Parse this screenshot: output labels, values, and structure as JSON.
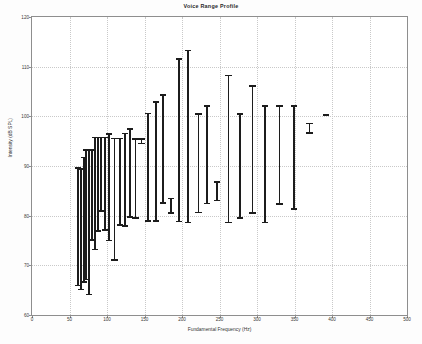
{
  "figure": {
    "title": "Voice Range Profile",
    "background_color": "#ffffff",
    "axis_color": "#8e8e8e",
    "grid_color": "#c9c9c9",
    "data_color": "#1c1c1c"
  },
  "chart_data": {
    "type": "bar",
    "title": "Voice Range Profile",
    "xlabel": "Fundamental Frequency (Hz)",
    "ylabel": "Intensity (dB SPL)",
    "xlim": [
      0,
      500
    ],
    "ylim": [
      60,
      120
    ],
    "xticks": [
      0,
      50,
      100,
      150,
      200,
      250,
      300,
      350,
      400,
      450,
      500
    ],
    "yticks": [
      60,
      70,
      80,
      90,
      100,
      110,
      120
    ],
    "grid": true,
    "legend": "none",
    "series_note": "Each vertical bar spans the minimum to maximum intensity measured at that fundamental frequency.",
    "x": [
      61,
      65,
      69,
      72,
      76,
      80,
      84,
      88,
      92,
      97,
      103,
      110,
      117,
      124,
      131,
      138,
      146,
      155,
      165,
      175,
      185,
      196,
      208,
      222,
      233,
      247,
      262,
      277,
      294,
      311,
      330,
      349,
      370,
      392,
      415,
      440,
      466,
      497
    ],
    "y_min": [
      65.8,
      65.0,
      66.5,
      67.0,
      64.0,
      74.9,
      73.0,
      76.8,
      80.8,
      76.9,
      74.8,
      70.9,
      78.0,
      77.8,
      79.6,
      79.4,
      78.8,
      78.8,
      82.4,
      78.7,
      80.4,
      80.5,
      82.3,
      78.5,
      79.4,
      80.3,
      78.5,
      82.9,
      81.9,
      82.2,
      81.2,
      96.5,
      100.2,
      100.2,
      100.2,
      100.2,
      100.2,
      100.2
    ],
    "y_max": [
      89.7,
      89.6,
      91.9,
      93.4,
      93.4,
      95.9,
      95.9,
      95.9,
      96.6,
      95.7,
      95.7,
      96.7,
      97.6,
      95.6,
      100.7,
      103.1,
      104.4,
      111.7,
      113.4,
      100.6,
      108.4,
      106.3,
      102.3,
      102.3,
      102.3,
      98.7,
      100.2,
      100.2,
      100.2,
      100.2,
      100.2,
      100.2,
      100.2,
      100.2,
      100.2,
      100.2,
      100.2,
      100.2
    ],
    "bars": [
      {
        "x": 61,
        "min": 65.8,
        "max": 89.7
      },
      {
        "x": 65,
        "min": 65.0,
        "max": 89.6
      },
      {
        "x": 69,
        "min": 66.5,
        "max": 91.9
      },
      {
        "x": 72,
        "min": 67.0,
        "max": 93.4
      },
      {
        "x": 76,
        "min": 64.0,
        "max": 93.4
      },
      {
        "x": 80,
        "min": 74.9,
        "max": 93.4
      },
      {
        "x": 84,
        "min": 73.0,
        "max": 95.9
      },
      {
        "x": 88,
        "min": 76.8,
        "max": 95.9
      },
      {
        "x": 92,
        "min": 80.8,
        "max": 95.9
      },
      {
        "x": 97,
        "min": 76.9,
        "max": 95.9
      },
      {
        "x": 103,
        "min": 74.8,
        "max": 96.6
      },
      {
        "x": 110,
        "min": 70.9,
        "max": 95.7
      },
      {
        "x": 117,
        "min": 78.0,
        "max": 95.7
      },
      {
        "x": 124,
        "min": 77.8,
        "max": 96.7
      },
      {
        "x": 131,
        "min": 79.6,
        "max": 97.6
      },
      {
        "x": 138,
        "min": 79.4,
        "max": 95.6
      },
      {
        "x": 146,
        "min": 94.4,
        "max": 95.6
      },
      {
        "x": 155,
        "min": 78.8,
        "max": 100.7
      },
      {
        "x": 165,
        "min": 78.8,
        "max": 103.1
      },
      {
        "x": 175,
        "min": 82.4,
        "max": 104.4
      },
      {
        "x": 185,
        "min": 80.4,
        "max": 83.6
      },
      {
        "x": 196,
        "min": 78.7,
        "max": 111.7
      },
      {
        "x": 208,
        "min": 78.5,
        "max": 113.4
      },
      {
        "x": 222,
        "min": 80.5,
        "max": 100.6
      },
      {
        "x": 233,
        "min": 82.3,
        "max": 102.3
      },
      {
        "x": 247,
        "min": 82.9,
        "max": 86.9
      },
      {
        "x": 262,
        "min": 78.5,
        "max": 108.4
      },
      {
        "x": 277,
        "min": 79.4,
        "max": 100.6
      },
      {
        "x": 294,
        "min": 80.4,
        "max": 106.3
      },
      {
        "x": 311,
        "min": 78.5,
        "max": 102.3
      },
      {
        "x": 330,
        "min": 82.2,
        "max": 102.3
      },
      {
        "x": 349,
        "min": 81.2,
        "max": 102.3
      },
      {
        "x": 370,
        "min": 96.5,
        "max": 98.7
      },
      {
        "x": 392,
        "min": 100.2,
        "max": 100.4
      }
    ]
  }
}
